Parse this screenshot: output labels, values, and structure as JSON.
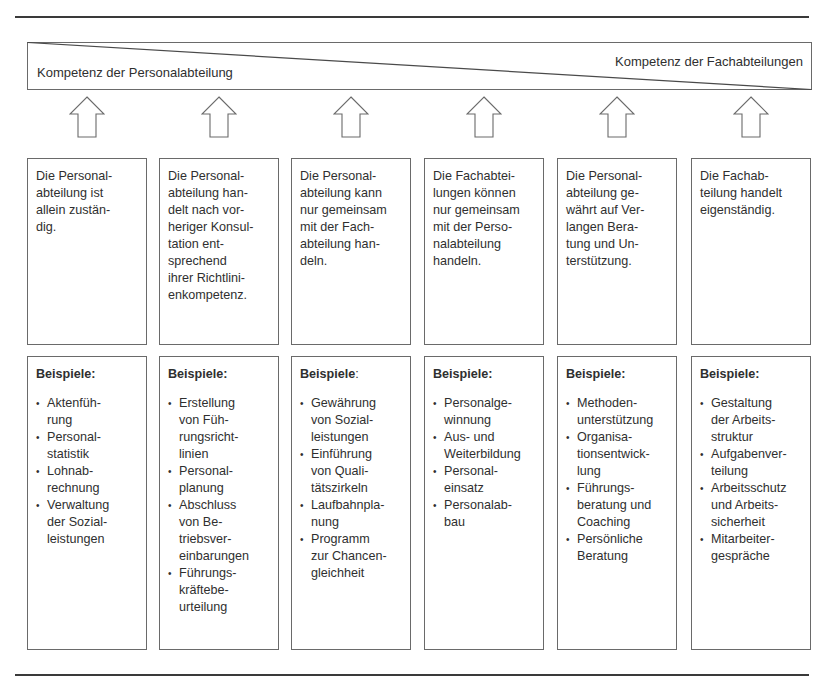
{
  "diagram": {
    "gradient_bar": {
      "left_label": "Kompetenz der Personalabteilung",
      "right_label": "Kompetenz der Fachabteilungen"
    },
    "arrow_icon": "up-arrow-outline",
    "columns": [
      {
        "description_lines": [
          "Die Personal-",
          "abteilung ist",
          "allein zustän-",
          "dig."
        ],
        "examples_heading": "Beispiele",
        "examples_heading_suffix": ":",
        "examples": [
          {
            "lines": [
              "Aktenfüh-",
              "rung"
            ]
          },
          {
            "lines": [
              "Personal-",
              "statistik"
            ]
          },
          {
            "lines": [
              "Lohnab-",
              "rechnung"
            ]
          },
          {
            "lines": [
              "Verwaltung",
              "der Sozial-",
              "leistungen"
            ]
          }
        ]
      },
      {
        "description_lines": [
          "Die Personal-",
          "abteilung han-",
          "delt nach vor-",
          "heriger Konsul-",
          "tation ent-",
          "sprechend",
          "ihrer Richtlini-",
          "enkompetenz."
        ],
        "examples_heading": "Beispiele",
        "examples_heading_suffix": ":",
        "examples": [
          {
            "lines": [
              "Erstellung",
              "von Füh-",
              "rungsricht-",
              "linien"
            ]
          },
          {
            "lines": [
              "Personal-",
              "planung"
            ]
          },
          {
            "lines": [
              "Abschluss",
              "von Be-",
              "triebsver-",
              "einbarungen"
            ]
          },
          {
            "lines": [
              "Führungs-",
              "kräftebe-",
              "urteilung"
            ]
          }
        ]
      },
      {
        "description_lines": [
          "Die Personal-",
          "abteilung kann",
          "nur gemeinsam",
          "mit der Fach-",
          "abteilung han-",
          "deln."
        ],
        "examples_heading": "Beispiele",
        "examples_heading_suffix": ":",
        "examples_heading_suffix_bold": false,
        "examples": [
          {
            "lines": [
              "Gewährung",
              "von Sozial-",
              "leistungen"
            ]
          },
          {
            "lines": [
              "Einführung",
              "von Quali-",
              "tätszirkeln"
            ]
          },
          {
            "lines": [
              "Laufbahnpla-",
              "nung"
            ]
          },
          {
            "lines": [
              "Programm",
              "zur Chancen-",
              "gleichheit"
            ]
          }
        ]
      },
      {
        "description_lines": [
          "Die Fachabtei-",
          "lungen können",
          "nur gemeinsam",
          "mit der Perso-",
          "nalabteilung",
          "handeln."
        ],
        "examples_heading": "Beispiele",
        "examples_heading_suffix": ":",
        "examples": [
          {
            "lines": [
              "Personalge-",
              "winnung"
            ]
          },
          {
            "lines": [
              "Aus- und",
              "Weiterbildung"
            ]
          },
          {
            "lines": [
              "Personal-",
              "einsatz"
            ]
          },
          {
            "lines": [
              "Personalab-",
              "bau"
            ]
          }
        ]
      },
      {
        "description_lines": [
          "Die Personal-",
          "abteilung ge-",
          "währt auf Ver-",
          "langen Bera-",
          "tung und Un-",
          "terstützung."
        ],
        "examples_heading": "Beispiele",
        "examples_heading_suffix": ":",
        "examples": [
          {
            "lines": [
              "Methoden-",
              "unterstützung"
            ]
          },
          {
            "lines": [
              "Organisa-",
              "tionsentwick-",
              "lung"
            ]
          },
          {
            "lines": [
              "Führungs-",
              "beratung und",
              "Coaching"
            ]
          },
          {
            "lines": [
              "Persönliche",
              "Beratung"
            ]
          }
        ]
      },
      {
        "description_lines": [
          "Die Fachab-",
          "teilung handelt",
          "eigenständig."
        ],
        "examples_heading": "Beispiele",
        "examples_heading_suffix": ":",
        "examples": [
          {
            "lines": [
              "Gestaltung",
              "der Arbeits-",
              "struktur"
            ]
          },
          {
            "lines": [
              "Aufgabenver-",
              "teilung"
            ]
          },
          {
            "lines": [
              "Arbeitsschutz",
              "und Arbeits-",
              "sicherheit"
            ]
          },
          {
            "lines": [
              "Mitarbeiter-",
              "gespräche"
            ]
          }
        ]
      }
    ],
    "bullet_glyph": "•",
    "colors": {
      "line": "#6a6a6a",
      "rule": "#3a3a3a",
      "text": "#2f2f2f",
      "background": "#ffffff"
    }
  }
}
